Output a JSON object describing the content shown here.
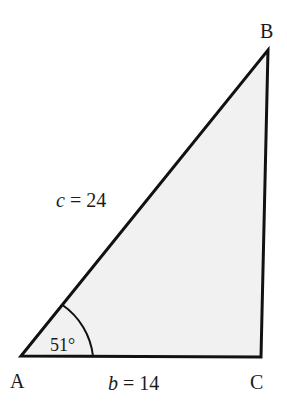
{
  "diagram": {
    "type": "right-triangle",
    "fill_color": "#f1f1f1",
    "stroke_color": "#111111",
    "vertices": {
      "A": {
        "label": "A",
        "x": 21,
        "y": 356
      },
      "B": {
        "label": "B",
        "x": 268,
        "y": 50
      },
      "C": {
        "label": "C",
        "x": 261,
        "y": 357
      }
    },
    "sides": {
      "c": {
        "var": "c",
        "eq": " = 24",
        "value": 24,
        "between": [
          "A",
          "B"
        ]
      },
      "b": {
        "var": "b",
        "eq": " = 14",
        "value": 14,
        "between": [
          "A",
          "C"
        ]
      }
    },
    "angle_A": {
      "text": "51°",
      "value": 51
    }
  }
}
